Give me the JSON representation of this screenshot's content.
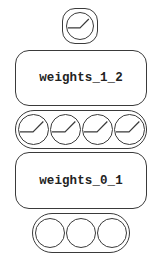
{
  "diagram": {
    "type": "neural-network",
    "stroke_color": "#3a3a3a",
    "layers": [
      {
        "name": "output-layer",
        "node_count": 1,
        "node_style": "gauge"
      },
      {
        "name": "hidden-layer",
        "node_count": 4,
        "node_style": "gauge"
      },
      {
        "name": "input-layer",
        "node_count": 3,
        "node_style": "empty"
      }
    ],
    "weights": [
      {
        "name": "weights-1-2",
        "label": "weights_1_2"
      },
      {
        "name": "weights-0-1",
        "label": "weights_0_1"
      }
    ]
  }
}
